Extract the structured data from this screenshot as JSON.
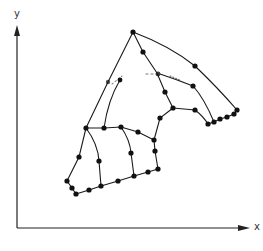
{
  "diagram": {
    "type": "finite-element-mesh",
    "axes": {
      "x_label": "x",
      "y_label": "y",
      "origin": [
        17,
        228
      ],
      "x_end": [
        248,
        228
      ],
      "y_end": [
        17,
        28
      ]
    },
    "colors": {
      "line": "#1a1a1a",
      "node": "#111111",
      "axis": "#222222",
      "background": "#ffffff"
    },
    "nodes": [
      {
        "id": "apex",
        "x": 133,
        "y": 32
      },
      {
        "id": "a2",
        "x": 143,
        "y": 52
      },
      {
        "id": "l1",
        "x": 108,
        "y": 82
      },
      {
        "id": "t1",
        "x": 195,
        "y": 66
      },
      {
        "id": "m1",
        "x": 158,
        "y": 74
      },
      {
        "id": "m2",
        "x": 193,
        "y": 86
      },
      {
        "id": "m3",
        "x": 165,
        "y": 92
      },
      {
        "id": "j1",
        "x": 173,
        "y": 108
      },
      {
        "id": "j2",
        "x": 195,
        "y": 110
      },
      {
        "id": "r1",
        "x": 208,
        "y": 124
      },
      {
        "id": "r2",
        "x": 214,
        "y": 122
      },
      {
        "id": "r3",
        "x": 220,
        "y": 119
      },
      {
        "id": "r4",
        "x": 227,
        "y": 117
      },
      {
        "id": "r5",
        "x": 234,
        "y": 114
      },
      {
        "id": "r6",
        "x": 237,
        "y": 110
      },
      {
        "id": "q1",
        "x": 86,
        "y": 128
      },
      {
        "id": "q2",
        "x": 104,
        "y": 128
      },
      {
        "id": "q3",
        "x": 121,
        "y": 127
      },
      {
        "id": "q4",
        "x": 138,
        "y": 132
      },
      {
        "id": "q5",
        "x": 154,
        "y": 140
      },
      {
        "id": "q6",
        "x": 160,
        "y": 118
      },
      {
        "id": "s1",
        "x": 79,
        "y": 157
      },
      {
        "id": "s2",
        "x": 99,
        "y": 161
      },
      {
        "id": "s3",
        "x": 131,
        "y": 153
      },
      {
        "id": "s4",
        "x": 155,
        "y": 151
      },
      {
        "id": "b1",
        "x": 67,
        "y": 181
      },
      {
        "id": "b2",
        "x": 72,
        "y": 188
      },
      {
        "id": "b3",
        "x": 76,
        "y": 194
      },
      {
        "id": "b4",
        "x": 89,
        "y": 190
      },
      {
        "id": "b5",
        "x": 101,
        "y": 186
      },
      {
        "id": "b6",
        "x": 118,
        "y": 181
      },
      {
        "id": "b7",
        "x": 134,
        "y": 176
      },
      {
        "id": "b8",
        "x": 148,
        "y": 172
      },
      {
        "id": "b9",
        "x": 158,
        "y": 169
      }
    ]
  }
}
